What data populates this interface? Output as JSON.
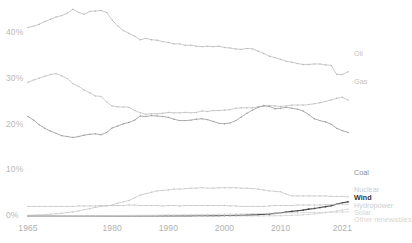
{
  "chart_data": {
    "type": "line",
    "title": "",
    "subtitle": "",
    "xlabel": "",
    "ylabel": "",
    "xlim": [
      1965,
      2022
    ],
    "ylim": [
      0,
      46
    ],
    "grid": false,
    "legend_position": "right-inline",
    "y_tick_labels": [
      "0%",
      "10%",
      "20%",
      "30%",
      "40%"
    ],
    "y_tick_values": [
      0,
      10,
      20,
      30,
      40
    ],
    "x_tick_labels": [
      "1965",
      "1980",
      "1990",
      "2000",
      "2010",
      "2021"
    ],
    "x_tick_values": [
      1965,
      1980,
      1990,
      2000,
      2010,
      2021
    ],
    "x": [
      1965,
      1966,
      1967,
      1968,
      1969,
      1970,
      1971,
      1972,
      1973,
      1974,
      1975,
      1976,
      1977,
      1978,
      1979,
      1980,
      1981,
      1982,
      1983,
      1984,
      1985,
      1986,
      1987,
      1988,
      1989,
      1990,
      1991,
      1992,
      1993,
      1994,
      1995,
      1996,
      1997,
      1998,
      1999,
      2000,
      2001,
      2002,
      2003,
      2004,
      2005,
      2006,
      2007,
      2008,
      2009,
      2010,
      2011,
      2012,
      2013,
      2014,
      2015,
      2016,
      2017,
      2018,
      2019,
      2020,
      2021,
      2022
    ],
    "series": [
      {
        "name": "Oil",
        "color": "#b8b8b8",
        "width": 0.75,
        "label_color": "#c2c2c2",
        "bold": false,
        "values": [
          41.3,
          41.6,
          42.0,
          42.6,
          43.1,
          43.6,
          43.9,
          44.4,
          45.3,
          44.6,
          44.2,
          44.8,
          44.9,
          45.0,
          44.6,
          42.9,
          41.6,
          40.6,
          40.0,
          39.4,
          38.6,
          38.9,
          38.6,
          38.5,
          38.2,
          38.0,
          37.7,
          37.7,
          37.4,
          37.4,
          37.2,
          37.1,
          37.2,
          37.1,
          37.2,
          36.9,
          36.8,
          36.6,
          36.5,
          36.7,
          36.6,
          36.1,
          35.6,
          35.0,
          34.7,
          34.3,
          33.9,
          33.7,
          33.4,
          33.2,
          33.2,
          33.3,
          33.3,
          33.1,
          33.0,
          31.0,
          31.0,
          31.6
        ]
      },
      {
        "name": "Gas",
        "color": "#bcbcbc",
        "width": 0.75,
        "label_color": "#c2c2c2",
        "bold": false,
        "values": [
          29.3,
          29.8,
          30.2,
          30.6,
          31.0,
          31.2,
          30.7,
          30.1,
          29.0,
          28.4,
          27.6,
          27.0,
          26.3,
          26.2,
          25.0,
          24.1,
          23.9,
          23.9,
          23.8,
          23.1,
          22.6,
          22.3,
          22.4,
          22.4,
          22.5,
          22.7,
          22.6,
          22.6,
          22.7,
          22.6,
          22.7,
          23.0,
          22.9,
          23.1,
          23.1,
          23.2,
          23.3,
          23.6,
          23.7,
          23.7,
          23.7,
          23.9,
          24.0,
          24.2,
          24.1,
          24.0,
          24.1,
          24.3,
          24.3,
          24.3,
          24.4,
          24.6,
          24.8,
          25.1,
          25.4,
          25.8,
          26.0,
          25.4
        ]
      },
      {
        "name": "Coal",
        "color": "#9f9f9f",
        "width": 0.85,
        "label_color": "#8d8d8d",
        "bold": false,
        "values": [
          21.8,
          21.0,
          20.0,
          19.2,
          18.6,
          18.1,
          17.6,
          17.4,
          17.2,
          17.4,
          17.7,
          17.9,
          18.0,
          17.8,
          18.3,
          19.3,
          19.7,
          20.2,
          20.5,
          21.0,
          21.9,
          21.8,
          22.0,
          21.9,
          21.8,
          21.6,
          21.2,
          20.9,
          20.9,
          21.0,
          21.2,
          21.3,
          21.1,
          20.7,
          20.3,
          20.2,
          20.4,
          20.9,
          21.7,
          22.5,
          23.2,
          23.8,
          24.2,
          24.0,
          23.5,
          23.6,
          23.8,
          23.6,
          23.4,
          23.0,
          22.2,
          21.3,
          20.9,
          20.6,
          20.1,
          19.2,
          18.7,
          18.3
        ]
      },
      {
        "name": "Nuclear",
        "color": "#c6c6c6",
        "width": 0.75,
        "label_color": "#cdcdcd",
        "bold": false,
        "values": [
          0.15,
          0.2,
          0.25,
          0.3,
          0.4,
          0.5,
          0.6,
          0.75,
          0.9,
          1.1,
          1.4,
          1.6,
          1.9,
          2.1,
          2.2,
          2.4,
          2.8,
          3.1,
          3.4,
          4.0,
          4.6,
          4.9,
          5.2,
          5.5,
          5.6,
          5.7,
          5.9,
          5.9,
          6.0,
          6.1,
          6.1,
          6.2,
          6.1,
          6.1,
          6.2,
          6.2,
          6.2,
          6.2,
          6.1,
          6.1,
          6.0,
          5.9,
          5.7,
          5.5,
          5.4,
          5.3,
          4.8,
          4.4,
          4.4,
          4.4,
          4.4,
          4.4,
          4.4,
          4.4,
          4.3,
          4.3,
          4.3,
          4.2
        ]
      },
      {
        "name": "Wind",
        "color": "#4a4a4a",
        "width": 1.15,
        "label_color": "#333333",
        "bold": true,
        "values": [
          0,
          0,
          0,
          0,
          0,
          0,
          0,
          0,
          0,
          0,
          0,
          0,
          0,
          0,
          0,
          0,
          0,
          0,
          0,
          0,
          0.01,
          0.01,
          0.01,
          0.01,
          0.02,
          0.02,
          0.02,
          0.03,
          0.03,
          0.04,
          0.05,
          0.05,
          0.06,
          0.07,
          0.09,
          0.1,
          0.12,
          0.14,
          0.17,
          0.2,
          0.25,
          0.3,
          0.38,
          0.46,
          0.58,
          0.7,
          0.85,
          1.0,
          1.15,
          1.3,
          1.5,
          1.65,
          1.85,
          2.05,
          2.25,
          2.6,
          2.9,
          3.1
        ]
      },
      {
        "name": "Hydropower",
        "color": "#c6c6c6",
        "width": 0.75,
        "label_color": "#cdcdcd",
        "bold": false,
        "values": [
          2.1,
          2.1,
          2.1,
          2.1,
          2.1,
          2.1,
          2.1,
          2.1,
          2.1,
          2.2,
          2.2,
          2.2,
          2.2,
          2.3,
          2.3,
          2.3,
          2.3,
          2.3,
          2.4,
          2.4,
          2.3,
          2.3,
          2.3,
          2.3,
          2.2,
          2.3,
          2.3,
          2.2,
          2.3,
          2.3,
          2.3,
          2.3,
          2.3,
          2.3,
          2.3,
          2.3,
          2.2,
          2.2,
          2.1,
          2.1,
          2.1,
          2.1,
          2.1,
          2.2,
          2.3,
          2.3,
          2.3,
          2.3,
          2.4,
          2.4,
          2.4,
          2.4,
          2.4,
          2.5,
          2.5,
          2.6,
          2.6,
          2.5
        ]
      },
      {
        "name": "Solar",
        "color": "#cfcfcf",
        "width": 0.7,
        "label_color": "#d4d4d4",
        "bold": false,
        "values": [
          0,
          0,
          0,
          0,
          0,
          0,
          0,
          0,
          0,
          0,
          0,
          0,
          0,
          0,
          0,
          0,
          0,
          0,
          0,
          0,
          0,
          0,
          0,
          0,
          0,
          0,
          0,
          0,
          0,
          0,
          0,
          0,
          0.01,
          0.01,
          0.01,
          0.01,
          0.01,
          0.01,
          0.01,
          0.02,
          0.02,
          0.02,
          0.03,
          0.04,
          0.05,
          0.07,
          0.1,
          0.14,
          0.2,
          0.27,
          0.35,
          0.45,
          0.58,
          0.72,
          0.88,
          1.1,
          1.3,
          1.5
        ]
      },
      {
        "name": "Other renewables",
        "color": "#d2d2d2",
        "width": 0.7,
        "label_color": "#d6d6d6",
        "bold": false,
        "values": [
          0.02,
          0.02,
          0.02,
          0.03,
          0.03,
          0.03,
          0.04,
          0.04,
          0.05,
          0.05,
          0.06,
          0.06,
          0.07,
          0.08,
          0.09,
          0.1,
          0.11,
          0.12,
          0.13,
          0.14,
          0.15,
          0.16,
          0.17,
          0.18,
          0.2,
          0.21,
          0.22,
          0.24,
          0.25,
          0.27,
          0.29,
          0.3,
          0.32,
          0.34,
          0.36,
          0.38,
          0.4,
          0.42,
          0.44,
          0.47,
          0.5,
          0.53,
          0.56,
          0.6,
          0.62,
          0.65,
          0.68,
          0.7,
          0.72,
          0.74,
          0.76,
          0.78,
          0.8,
          0.82,
          0.84,
          0.85,
          0.87,
          0.9
        ]
      }
    ],
    "label_positions": [
      {
        "name": "Oil",
        "top": 50
      },
      {
        "name": "Gas",
        "top": 78
      },
      {
        "name": "Coal",
        "top": 169
      },
      {
        "name": "Nuclear",
        "top": 186
      },
      {
        "name": "Wind",
        "top": 194
      },
      {
        "name": "Hydropower",
        "top": 202
      },
      {
        "name": "Solar",
        "top": 209
      },
      {
        "name": "Other renewables",
        "top": 216
      }
    ]
  }
}
